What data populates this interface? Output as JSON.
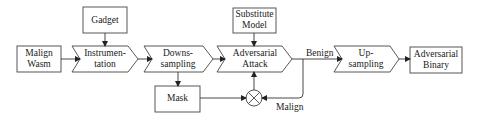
{
  "diagram": {
    "nodes": {
      "malign_wasm": {
        "line1": "Malign",
        "line2": "Wasm"
      },
      "gadget": {
        "label": "Gadget"
      },
      "instrumentation": {
        "line1": "Instrumen-",
        "line2": "tation"
      },
      "downsampling": {
        "line1": "Downs-",
        "line2": "sampling"
      },
      "mask": {
        "label": "Mask"
      },
      "substitute_model": {
        "line1": "Substitute",
        "line2": "Model"
      },
      "adversarial_attack": {
        "line1": "Adversarial",
        "line2": "Attack"
      },
      "upsampling": {
        "line1": "Up-",
        "line2": "sampling"
      },
      "adversarial_binary": {
        "line1": "Adversarial",
        "line2": "Binary"
      }
    },
    "edge_labels": {
      "benign": "Benign",
      "malign": "Malign"
    },
    "colors": {
      "stroke": "#333333",
      "text": "#1a1a1a",
      "background": "#ffffff"
    }
  }
}
